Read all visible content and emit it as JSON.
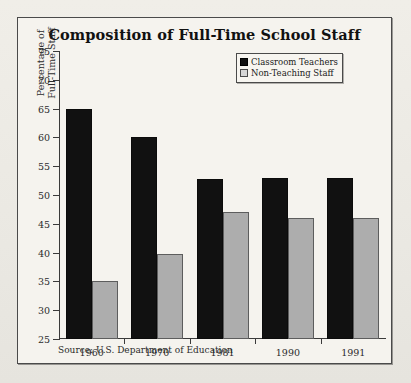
{
  "chart_data": {
    "type": "bar",
    "title": "Composition of Full-Time School Staff",
    "xlabel": "",
    "ylabel": "Percentage of Full-Time Staff",
    "ylabel_lines": [
      "Percentage of",
      "Full-Time Staff"
    ],
    "categories": [
      "1960",
      "1970",
      "1981",
      "1990",
      "1991"
    ],
    "series": [
      {
        "name": "Classroom Teachers",
        "color": "#111111",
        "values": [
          65,
          60,
          52.8,
          53,
          53
        ]
      },
      {
        "name": "Non-Teaching Staff",
        "color": "#adadad",
        "values": [
          35,
          39.8,
          47,
          46,
          46
        ]
      }
    ],
    "ylim": [
      25,
      75
    ],
    "ytick_step": 5,
    "yticks": [
      25,
      30,
      35,
      40,
      45,
      50,
      55,
      60,
      65,
      70,
      75
    ],
    "grid": false,
    "legend_position": "top-right"
  },
  "source_note": "Source: U.S. Department of Education"
}
